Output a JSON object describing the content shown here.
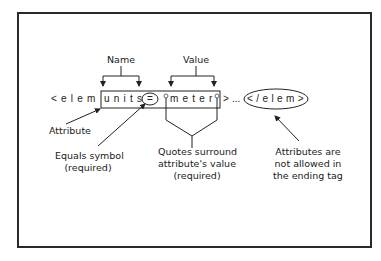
{
  "diagram": {
    "labels": {
      "name": "Name",
      "value": "Value",
      "attribute": "Attribute",
      "equals_line1": "Equals symbol",
      "equals_line2": "(required)",
      "quotes_line1": "Quotes surround",
      "quotes_line2": "attribute's value",
      "quotes_line3": "(required)",
      "end_line1": "Attributes are",
      "end_line2": "not allowed in",
      "end_line3": "the ending tag"
    },
    "code": {
      "open_tag": "<elem",
      "attr_name": "units",
      "equals": "=",
      "attr_value": "meter",
      "close_bracket": ">",
      "ellipsis": "...",
      "end_tag": "</elem>"
    }
  }
}
